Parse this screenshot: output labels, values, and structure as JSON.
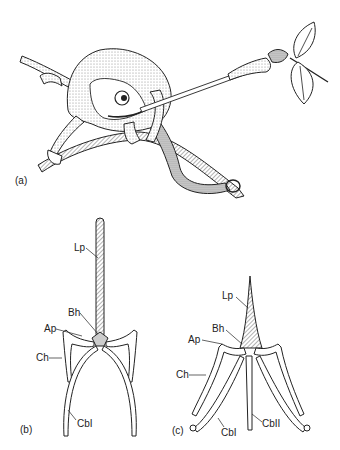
{
  "figure": {
    "panels": [
      {
        "id": "a",
        "label": "(a)",
        "subject": "chameleon-catching-insect"
      },
      {
        "id": "b",
        "label": "(b)",
        "subject": "hyobranchial-apparatus-resting"
      },
      {
        "id": "c",
        "label": "(c)",
        "subject": "hyobranchial-apparatus-protracted"
      }
    ],
    "panel_b_labels": {
      "lp": "Lp",
      "bh": "Bh",
      "ap": "Ap",
      "ch": "Ch",
      "cbi": "CbI"
    },
    "panel_c_labels": {
      "lp": "Lp",
      "bh": "Bh",
      "ap": "Ap",
      "ch": "Ch",
      "cbi": "CbI",
      "cbii": "CbII"
    }
  }
}
